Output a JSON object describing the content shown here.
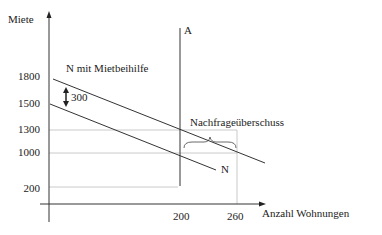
{
  "diagram": {
    "y_axis_label": "Miete",
    "x_axis_label": "Anzahl Wohnungen",
    "y_ticks": [
      "1800",
      "1500",
      "1300",
      "1000",
      "200"
    ],
    "x_ticks": [
      "200",
      "260"
    ],
    "supply_label": "A",
    "demand_label": "N",
    "demand_subsidy_label": "N mit Mietbeihilfe",
    "shift_label": "300",
    "excess_label": "Nachfrageüberschuss",
    "colors": {
      "line": "#333333",
      "guide": "#bbbbbb"
    }
  }
}
